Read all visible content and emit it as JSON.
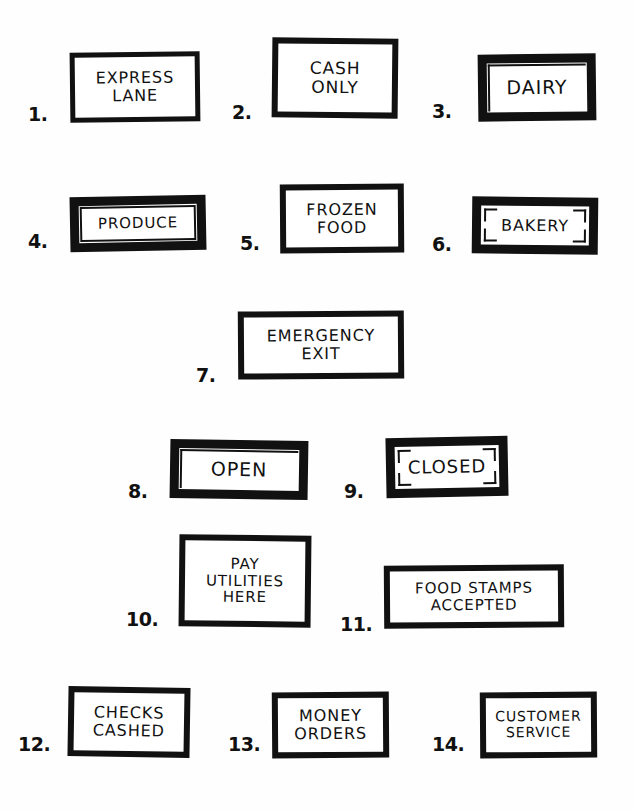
{
  "page": {
    "background_color": "#fefefe",
    "ink_color": "#111111",
    "item_count": 14
  },
  "signs": [
    {
      "number": "1.",
      "text": "EXPRESS\nLANE",
      "lines": [
        "EXPRESS",
        "LANE"
      ],
      "style": "plain",
      "font_size": 16
    },
    {
      "number": "2.",
      "text": "CASH\nONLY",
      "lines": [
        "CASH",
        "ONLY"
      ],
      "style": "plain",
      "font_size": 17
    },
    {
      "number": "3.",
      "text": "DAIRY",
      "lines": [
        "DAIRY"
      ],
      "style": "thick-inner-corner-line",
      "font_size": 19
    },
    {
      "number": "4.",
      "text": "PRODUCE",
      "lines": [
        "PRODUCE"
      ],
      "style": "thick-inner-rect",
      "font_size": 15
    },
    {
      "number": "5.",
      "text": "FROZEN\nFOOD",
      "lines": [
        "FROZEN",
        "FOOD"
      ],
      "style": "plain",
      "font_size": 16
    },
    {
      "number": "6.",
      "text": "BAKERY",
      "lines": [
        "BAKERY"
      ],
      "style": "thick-corner-brackets",
      "font_size": 16
    },
    {
      "number": "7.",
      "text": "EMERGENCY\nEXIT",
      "lines": [
        "EMERGENCY",
        "EXIT"
      ],
      "style": "plain",
      "font_size": 16
    },
    {
      "number": "8.",
      "text": "OPEN",
      "lines": [
        "OPEN"
      ],
      "style": "thick-inner-corner-line",
      "font_size": 19
    },
    {
      "number": "9.",
      "text": "CLOSED",
      "lines": [
        "CLOSED"
      ],
      "style": "thick-corner-brackets",
      "font_size": 18
    },
    {
      "number": "10.",
      "text": "PAY\nUTILITIES\nHERE",
      "lines": [
        "PAY",
        "UTILITIES",
        "HERE"
      ],
      "style": "plain",
      "font_size": 15
    },
    {
      "number": "11.",
      "text": "FOOD STAMPS\nACCEPTED",
      "lines": [
        "FOOD STAMPS",
        "ACCEPTED"
      ],
      "style": "plain",
      "font_size": 15
    },
    {
      "number": "12.",
      "text": "CHECKS\nCASHED",
      "lines": [
        "CHECKS",
        "CASHED"
      ],
      "style": "plain",
      "font_size": 16
    },
    {
      "number": "13.",
      "text": "MONEY\nORDERS",
      "lines": [
        "MONEY",
        "ORDERS"
      ],
      "style": "plain",
      "font_size": 16
    },
    {
      "number": "14.",
      "text": "CUSTOMER\nSERVICE",
      "lines": [
        "CUSTOMER",
        "SERVICE"
      ],
      "style": "plain",
      "font_size": 14
    }
  ]
}
